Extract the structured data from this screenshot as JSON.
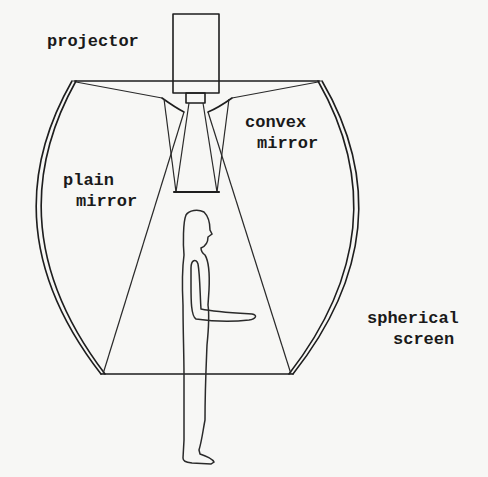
{
  "diagram": {
    "type": "projection-display-schematic",
    "labels": {
      "projector": "projector",
      "convex_mirror": [
        "convex",
        "mirror"
      ],
      "plain_mirror": [
        "plain",
        "mirror"
      ],
      "spherical_screen": [
        "spherical",
        "screen"
      ]
    },
    "components": [
      "projector",
      "convex mirror",
      "plain mirror",
      "spherical screen",
      "human figure"
    ],
    "colors": {
      "line": "#1e1e1e",
      "background": "#f7f7f5"
    }
  }
}
